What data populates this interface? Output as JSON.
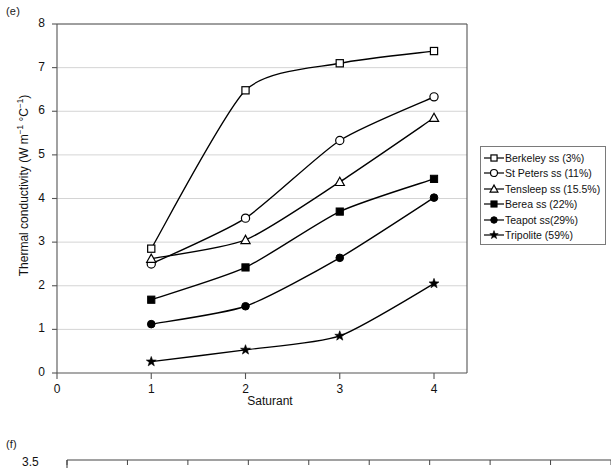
{
  "panels": {
    "e": {
      "letter": "(e)"
    },
    "f": {
      "letter": "(f)",
      "first_ytick": "3.5"
    }
  },
  "chart_data": {
    "type": "line",
    "title": "",
    "xlabel": "Saturant",
    "ylabel": "Thermal conductivity (W m−1 °C−1)",
    "ylabel_parts": {
      "main": "Thermal conductivity (W m",
      "sup1": "−1",
      "mid": " °C",
      "sup2": "−1",
      "tail": ")"
    },
    "x": [
      1,
      2,
      3,
      4
    ],
    "xlim": [
      0,
      4.35
    ],
    "ylim": [
      0,
      8
    ],
    "xticks": [
      "0",
      "1",
      "2",
      "3",
      "4"
    ],
    "xtick_values": [
      0,
      1,
      2,
      3,
      4
    ],
    "yticks": [
      "0",
      "1",
      "2",
      "3",
      "4",
      "5",
      "6",
      "7",
      "8"
    ],
    "ytick_values": [
      0,
      1,
      2,
      3,
      4,
      5,
      6,
      7,
      8
    ],
    "grid": true,
    "grid_axis": "y",
    "legend_position": "right-outside",
    "series": [
      {
        "name": "Berkeley ss (3%)",
        "marker": "open-square",
        "values": [
          2.85,
          6.48,
          7.1,
          7.38
        ]
      },
      {
        "name": "St Peters ss (11%)",
        "marker": "open-circle",
        "values": [
          2.5,
          3.55,
          5.33,
          6.33
        ]
      },
      {
        "name": "Tensleep ss (15.5%)",
        "marker": "open-triangle",
        "values": [
          2.62,
          3.05,
          4.38,
          5.85
        ]
      },
      {
        "name": "Berea ss (22%)",
        "marker": "filled-square",
        "values": [
          1.68,
          2.42,
          3.7,
          4.45
        ]
      },
      {
        "name": "Teapot ss(29%)",
        "marker": "filled-circle",
        "values": [
          1.12,
          1.53,
          2.64,
          4.02
        ]
      },
      {
        "name": "Tripolite (59%)",
        "marker": "filled-star",
        "values": [
          0.26,
          0.53,
          0.85,
          2.05
        ]
      }
    ]
  },
  "colors": {
    "line": "#000000",
    "grid": "#c9c9c9",
    "axis": "#555555",
    "text": "#111111"
  },
  "panel_f_axis": {
    "ticks": 9
  }
}
